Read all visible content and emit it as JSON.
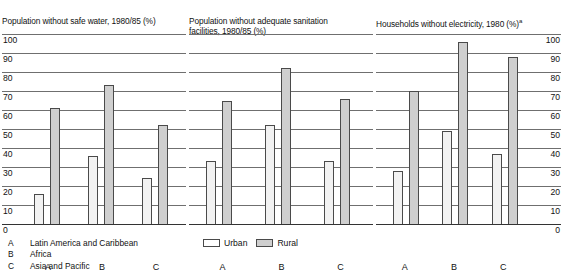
{
  "chart_data": {
    "type": "bar",
    "categories": [
      "A",
      "B",
      "C"
    ],
    "category_key": [
      {
        "letter": "A",
        "name": "Latin America and Caribbean"
      },
      {
        "letter": "B",
        "name": "Africa"
      },
      {
        "letter": "C",
        "name": "Asia and Pacific"
      }
    ],
    "legend": {
      "position": "bottom-center",
      "entries": [
        {
          "name": "Urban",
          "color": "#ffffff"
        },
        {
          "name": "Rural",
          "color": "#cfcfcf"
        }
      ]
    },
    "ylim": [
      0,
      100
    ],
    "ytick_values": [
      100,
      90,
      80,
      70,
      60,
      50,
      40,
      30,
      20,
      10,
      0
    ],
    "ytick_labels": [
      "100",
      "90",
      "80",
      "70",
      "60",
      "50",
      "40",
      "30",
      "20",
      "10",
      "0"
    ],
    "grid": true,
    "xlabel": "",
    "ylabel": "",
    "panels": [
      {
        "title": "Population without safe water, 1980/85 (%)",
        "title_superscript": "",
        "axis_side": "left",
        "series": [
          {
            "name": "Urban",
            "values": [
              16,
              36,
              24
            ]
          },
          {
            "name": "Rural",
            "values": [
              61,
              73,
              52
            ]
          }
        ]
      },
      {
        "title": "Population without adequate sanitation\nfacilities, 1980/85 (%)",
        "title_superscript": "",
        "axis_side": "none",
        "series": [
          {
            "name": "Urban",
            "values": [
              33,
              52,
              33
            ]
          },
          {
            "name": "Rural",
            "values": [
              65,
              82,
              66
            ]
          }
        ]
      },
      {
        "title": "Households without electricity, 1980 (%)",
        "title_superscript": "a",
        "axis_side": "right",
        "series": [
          {
            "name": "Urban",
            "values": [
              28,
              49,
              37
            ]
          },
          {
            "name": "Rural",
            "values": [
              70,
              96,
              88
            ]
          }
        ]
      }
    ]
  },
  "colors": {
    "urban_fill": "#f2f2f2",
    "rural_fill": "#cfcfcf",
    "bar_border": "#4a4a4a",
    "gridline": "#6f6f6f",
    "text": "#111111"
  }
}
